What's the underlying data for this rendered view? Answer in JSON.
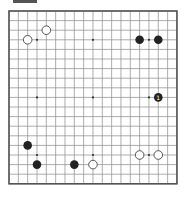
{
  "board": {
    "size": 19,
    "origin_x": 9,
    "origin_y": 11,
    "cell_w": 9.33,
    "cell_h": 9.6,
    "line_color": "#8a8a8a",
    "edge_color": "#555555",
    "star_color": "#333333",
    "star_points": [
      [
        3,
        3
      ],
      [
        9,
        3
      ],
      [
        15,
        3
      ],
      [
        3,
        9
      ],
      [
        9,
        9
      ],
      [
        15,
        9
      ],
      [
        3,
        15
      ],
      [
        9,
        15
      ],
      [
        15,
        15
      ]
    ]
  },
  "stones": [
    {
      "color": "white",
      "col": 2,
      "row": 3
    },
    {
      "color": "white",
      "col": 4,
      "row": 2
    },
    {
      "color": "black",
      "col": 14,
      "row": 3
    },
    {
      "color": "black",
      "col": 16,
      "row": 3
    },
    {
      "color": "black",
      "col": 16,
      "row": 9,
      "label": "1"
    },
    {
      "color": "black",
      "col": 2,
      "row": 14
    },
    {
      "color": "black",
      "col": 3,
      "row": 16
    },
    {
      "color": "black",
      "col": 7,
      "row": 16
    },
    {
      "color": "white",
      "col": 9,
      "row": 16
    },
    {
      "color": "white",
      "col": 14,
      "row": 15
    },
    {
      "color": "white",
      "col": 16,
      "row": 15
    }
  ],
  "colors": {
    "black_stone": "#222222",
    "white_stone_fill": "#ffffff",
    "white_stone_stroke": "#444444",
    "label_on_black": "#ffffff"
  }
}
